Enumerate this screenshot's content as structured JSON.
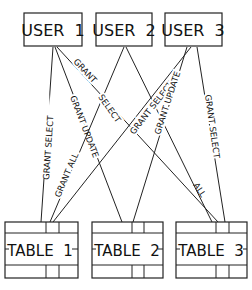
{
  "users": [
    {
      "id": "u1",
      "label": "USER  1"
    },
    {
      "id": "u2",
      "label": "USER  2"
    },
    {
      "id": "u3",
      "label": "USER  3"
    }
  ],
  "tables": [
    {
      "id": "t1",
      "label": "TABLE  1"
    },
    {
      "id": "t2",
      "label": "TABLE  2"
    },
    {
      "id": "t3",
      "label": "TABLE  3"
    }
  ],
  "edges": [
    {
      "from": "u1",
      "to": "t1",
      "label": "GRANT SELECT"
    },
    {
      "from": "u1",
      "to": "t2",
      "label": "GRANT UPDATE"
    },
    {
      "from": "u1",
      "to": "t3",
      "label": "GRANT ALL"
    },
    {
      "from": "u2",
      "to": "t1",
      "label": "GRANT ALL"
    },
    {
      "from": "u2",
      "to": "t3",
      "label": "GRANT SELECT"
    },
    {
      "from": "u3",
      "to": "t1",
      "label": "GRANT UPDATE"
    },
    {
      "from": "u3",
      "to": "t2",
      "label": "GRANT SELECT"
    },
    {
      "from": "u3",
      "to": "t3",
      "label": "GRANT SELECT"
    }
  ]
}
